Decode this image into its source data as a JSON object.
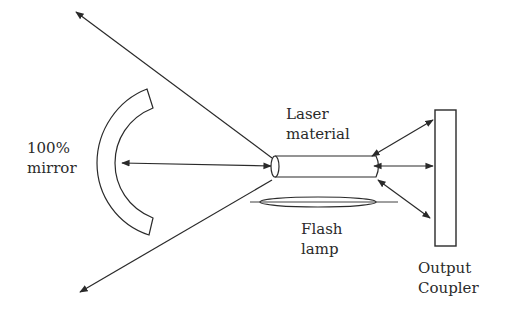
{
  "diagram": {
    "type": "laser-cavity-schematic",
    "components": [
      {
        "id": "mirror",
        "label_lines": [
          "100%",
          "mirror"
        ]
      },
      {
        "id": "laser_material",
        "label_lines": [
          "Laser",
          "material"
        ]
      },
      {
        "id": "flash_lamp",
        "label_lines": [
          "Flash",
          "lamp"
        ]
      },
      {
        "id": "output_coupler",
        "label_lines": [
          "Output",
          "Coupler"
        ]
      }
    ],
    "colors": {
      "stroke": "#2a2a2a",
      "background": "#ffffff"
    }
  },
  "labels": {
    "mirror": {
      "line1": "100%",
      "line2": "mirror"
    },
    "laser_material": {
      "line1": "Laser",
      "line2": "material"
    },
    "flash_lamp": {
      "line1": "Flash",
      "line2": "lamp"
    },
    "output_coupler": {
      "line1": "Output",
      "line2": "Coupler"
    }
  }
}
